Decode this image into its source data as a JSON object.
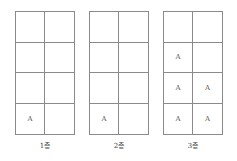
{
  "floors": [
    {
      "label": "1층",
      "cells": [
        "",
        "",
        "",
        "",
        "",
        "",
        "A",
        ""
      ]
    },
    {
      "label": "2층",
      "cells": [
        "",
        "",
        "",
        "",
        "",
        "",
        "A",
        ""
      ]
    },
    {
      "label": "3층",
      "cells": [
        "",
        "",
        "A",
        "",
        "A",
        "A",
        "A",
        "A"
      ]
    }
  ]
}
